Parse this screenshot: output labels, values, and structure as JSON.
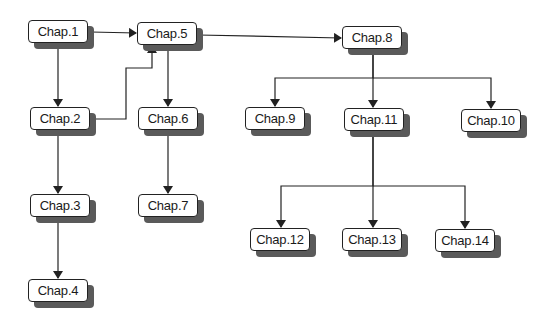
{
  "diagram": {
    "type": "chapter-dependency-tree",
    "colors": {
      "background": "#ffffff",
      "box_fill": "#ffffff",
      "box_border": "#222222",
      "shadow": "#5a5a5a",
      "edge": "#222222"
    },
    "nodes": [
      {
        "id": "c1",
        "label": "Chap.1",
        "x": 28,
        "y": 20
      },
      {
        "id": "c5",
        "label": "Chap.5",
        "x": 137,
        "y": 22
      },
      {
        "id": "c8",
        "label": "Chap.8",
        "x": 342,
        "y": 26
      },
      {
        "id": "c2",
        "label": "Chap.2",
        "x": 30,
        "y": 107
      },
      {
        "id": "c6",
        "label": "Chap.6",
        "x": 138,
        "y": 107
      },
      {
        "id": "c9",
        "label": "Chap.9",
        "x": 245,
        "y": 107
      },
      {
        "id": "c11",
        "label": "Chap.11",
        "x": 344,
        "y": 108
      },
      {
        "id": "c10",
        "label": "Chap.10",
        "x": 461,
        "y": 109
      },
      {
        "id": "c3",
        "label": "Chap.3",
        "x": 30,
        "y": 194
      },
      {
        "id": "c7",
        "label": "Chap.7",
        "x": 138,
        "y": 194
      },
      {
        "id": "c12",
        "label": "Chap.12",
        "x": 250,
        "y": 228
      },
      {
        "id": "c13",
        "label": "Chap.13",
        "x": 342,
        "y": 228
      },
      {
        "id": "c14",
        "label": "Chap.14",
        "x": 435,
        "y": 229
      },
      {
        "id": "c4",
        "label": "Chap.4",
        "x": 28,
        "y": 279
      }
    ],
    "edges": [
      {
        "from": "Chap.1",
        "to": "Chap.5",
        "points": [
          [
            91,
            32
          ],
          [
            136,
            33
          ]
        ]
      },
      {
        "from": "Chap.1",
        "to": "Chap.2",
        "points": [
          [
            58,
            44
          ],
          [
            58,
            106
          ]
        ]
      },
      {
        "from": "Chap.2",
        "to": "Chap.5",
        "points": [
          [
            91,
            119
          ],
          [
            126,
            119
          ],
          [
            126,
            68
          ],
          [
            152,
            68
          ],
          [
            152,
            46
          ]
        ]
      },
      {
        "from": "Chap.5",
        "to": "Chap.6",
        "points": [
          [
            168,
            46
          ],
          [
            168,
            106
          ]
        ]
      },
      {
        "from": "Chap.5",
        "to": "Chap.8",
        "points": [
          [
            198,
            35
          ],
          [
            341,
            38
          ]
        ]
      },
      {
        "from": "Chap.2",
        "to": "Chap.3",
        "points": [
          [
            58,
            131
          ],
          [
            58,
            193
          ]
        ]
      },
      {
        "from": "Chap.3",
        "to": "Chap.4",
        "points": [
          [
            58,
            218
          ],
          [
            58,
            278
          ]
        ]
      },
      {
        "from": "Chap.6",
        "to": "Chap.7",
        "points": [
          [
            168,
            131
          ],
          [
            168,
            193
          ]
        ]
      },
      {
        "from": "Chap.8",
        "to": "Chap.9",
        "points": [
          [
            373,
            50
          ],
          [
            373,
            78
          ],
          [
            275,
            78
          ],
          [
            275,
            106
          ]
        ]
      },
      {
        "from": "Chap.8",
        "to": "Chap.11",
        "points": [
          [
            373,
            50
          ],
          [
            373,
            107
          ]
        ]
      },
      {
        "from": "Chap.8",
        "to": "Chap.10",
        "points": [
          [
            373,
            78
          ],
          [
            491,
            78
          ],
          [
            491,
            108
          ]
        ]
      },
      {
        "from": "Chap.11",
        "to": "Chap.12",
        "points": [
          [
            373,
            132
          ],
          [
            373,
            186
          ],
          [
            281,
            186
          ],
          [
            281,
            227
          ]
        ]
      },
      {
        "from": "Chap.11",
        "to": "Chap.13",
        "points": [
          [
            373,
            132
          ],
          [
            373,
            227
          ]
        ]
      },
      {
        "from": "Chap.11",
        "to": "Chap.14",
        "points": [
          [
            373,
            186
          ],
          [
            465,
            186
          ],
          [
            465,
            228
          ]
        ]
      }
    ]
  }
}
